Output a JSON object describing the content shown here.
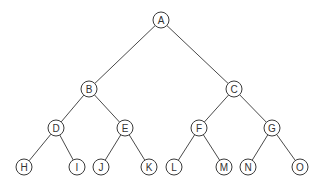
{
  "diagram": {
    "type": "binary-tree",
    "root": "A",
    "nodes": [
      {
        "id": "A",
        "label": "A",
        "level": 0,
        "order": 0
      },
      {
        "id": "B",
        "label": "B",
        "level": 1,
        "order": 0
      },
      {
        "id": "C",
        "label": "C",
        "level": 1,
        "order": 1
      },
      {
        "id": "D",
        "label": "D",
        "level": 2,
        "order": 0
      },
      {
        "id": "E",
        "label": "E",
        "level": 2,
        "order": 1
      },
      {
        "id": "F",
        "label": "F",
        "level": 2,
        "order": 2
      },
      {
        "id": "G",
        "label": "G",
        "level": 2,
        "order": 3
      },
      {
        "id": "H",
        "label": "H",
        "level": 3,
        "order": 0
      },
      {
        "id": "I",
        "label": "I",
        "level": 3,
        "order": 1
      },
      {
        "id": "J",
        "label": "J",
        "level": 3,
        "order": 2
      },
      {
        "id": "K",
        "label": "K",
        "level": 3,
        "order": 3
      },
      {
        "id": "L",
        "label": "L",
        "level": 3,
        "order": 4
      },
      {
        "id": "M",
        "label": "M",
        "level": 3,
        "order": 5
      },
      {
        "id": "N",
        "label": "N",
        "level": 3,
        "order": 6
      },
      {
        "id": "O",
        "label": "O",
        "level": 3,
        "order": 7
      }
    ],
    "edges": [
      {
        "from": "A",
        "to": "B"
      },
      {
        "from": "A",
        "to": "C"
      },
      {
        "from": "B",
        "to": "D"
      },
      {
        "from": "B",
        "to": "E"
      },
      {
        "from": "C",
        "to": "F"
      },
      {
        "from": "C",
        "to": "G"
      },
      {
        "from": "D",
        "to": "H"
      },
      {
        "from": "D",
        "to": "I"
      },
      {
        "from": "E",
        "to": "J"
      },
      {
        "from": "E",
        "to": "K"
      },
      {
        "from": "F",
        "to": "L"
      },
      {
        "from": "F",
        "to": "M"
      },
      {
        "from": "G",
        "to": "N"
      },
      {
        "from": "G",
        "to": "O"
      }
    ]
  }
}
